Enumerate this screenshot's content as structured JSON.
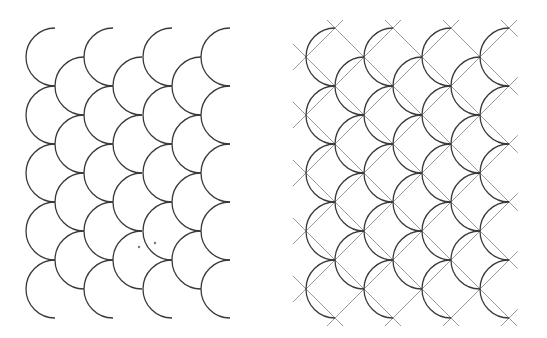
{
  "figure": {
    "width": 547,
    "height": 338,
    "background": "#ffffff",
    "arc_color": "#3a3a3a",
    "arc_width": 1.3,
    "guide_color": "#9a9a9a",
    "guide_width": 1.0,
    "radius": 29,
    "spacing": 58
  },
  "panels": [
    {
      "name": "scale-pattern-plain",
      "col_x": [
        55,
        113,
        172,
        230
      ],
      "offset_col_x": [
        84,
        142,
        201
      ],
      "row_y": [
        57,
        115,
        173,
        231,
        289
      ],
      "offset_row_y": [
        86,
        144,
        202,
        260
      ],
      "show_guides": false,
      "dots": [
        [
          139,
          247
        ],
        [
          155,
          243
        ]
      ]
    },
    {
      "name": "scale-pattern-with-guides",
      "col_x": [
        335,
        393,
        451,
        509
      ],
      "offset_col_x": [
        364,
        422,
        480
      ],
      "row_y": [
        57,
        115,
        173,
        231,
        289
      ],
      "offset_row_y": [
        86,
        144,
        202,
        260
      ],
      "show_guides": true,
      "dots": []
    }
  ]
}
